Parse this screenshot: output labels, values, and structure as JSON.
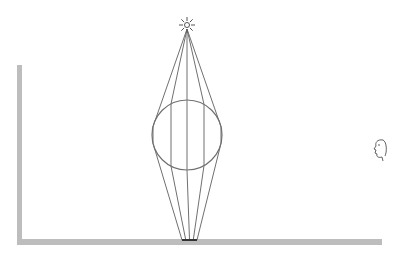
{
  "diagram": {
    "type": "optics-illustration",
    "colors": {
      "background": "#ffffff",
      "wall_floor": "#bdbdbd",
      "rays": "#707070",
      "sphere": "#707070",
      "shadow": "#333333",
      "face": "#606060",
      "sun": "#555555"
    },
    "light_source": {
      "icon": "sun-icon",
      "x": 187,
      "y": 25
    },
    "sphere": {
      "cx": 187,
      "cy": 135,
      "r": 35
    },
    "wall": {
      "x": 17,
      "y_top": 65,
      "y_bottom": 245,
      "width": 5
    },
    "floor": {
      "x_left": 17,
      "x_right": 382,
      "y": 239,
      "height": 6
    },
    "focus_on_floor": {
      "x_left": 182,
      "x_right": 197,
      "y": 240
    },
    "rays_through_sphere_x": [
      153,
      171,
      187,
      204,
      221
    ],
    "observer": {
      "icon": "face-profile-icon",
      "x": 378,
      "y": 150
    }
  }
}
